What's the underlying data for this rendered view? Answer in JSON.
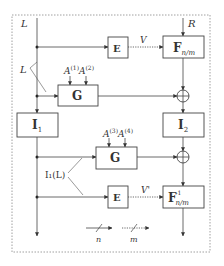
{
  "diagram": {
    "inputs": {
      "left_input": "L",
      "right_input": "R",
      "left_branch_label": "L",
      "i1_output_label": "I₁(L)"
    },
    "blocks": {
      "e_top": {
        "label": "E"
      },
      "f_top": {
        "label": "F",
        "subscript": "n/m"
      },
      "g_top": {
        "label": "G"
      },
      "i1": {
        "label": "I",
        "subscript": "1"
      },
      "i2": {
        "label": "I",
        "subscript": "2"
      },
      "g_bottom": {
        "label": "G"
      },
      "e_bottom": {
        "label": "E"
      },
      "f_inv": {
        "label": "F",
        "subscript": "n/m",
        "superscript": "-1"
      }
    },
    "signals": {
      "v_top": "V",
      "v_bottom": "V'",
      "g_top_params": [
        "A",
        "(1)",
        "A",
        "(2)"
      ],
      "g_bottom_params": [
        "A",
        "(3)",
        "A",
        "(4)"
      ]
    },
    "legend": {
      "solid_label": "n",
      "dotted_label": "m"
    },
    "colors": {
      "line": "#444444",
      "border": "#888888"
    }
  }
}
